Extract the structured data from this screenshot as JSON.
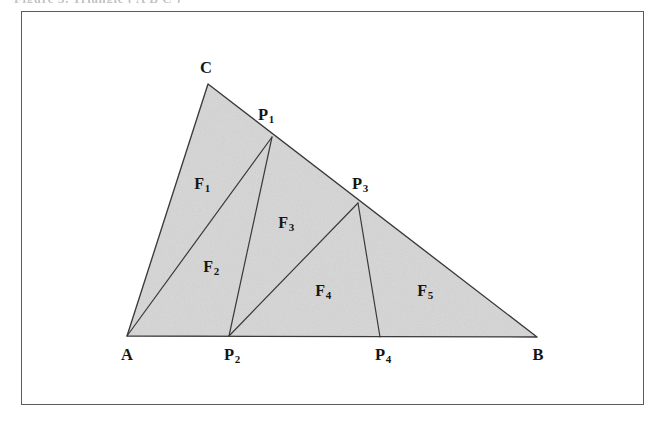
{
  "figure": {
    "caption_sliver": "Figure 3.  Triangle  ( A B C )",
    "frame": {
      "x": 21,
      "y": 11,
      "width": 623,
      "height": 394,
      "border_color": "#5c5c60"
    },
    "background_color": "#ffffff",
    "fill_color": "#d6d6d6",
    "stroke_color": "#3a3a3a"
  },
  "diagram": {
    "type": "geometry-triangle-subdivision",
    "outline": [
      "A",
      "C",
      "B"
    ],
    "points": {
      "A": {
        "x": 127,
        "y": 336,
        "label": "A"
      },
      "B": {
        "x": 537,
        "y": 337,
        "label": "B"
      },
      "C": {
        "x": 208,
        "y": 84,
        "label": "C"
      },
      "P1": {
        "x": 272,
        "y": 137,
        "label": "P",
        "sub": "1"
      },
      "P2": {
        "x": 229,
        "y": 336,
        "label": "P",
        "sub": "2"
      },
      "P3": {
        "x": 358,
        "y": 203,
        "label": "P",
        "sub": "3"
      },
      "P4": {
        "x": 380,
        "y": 337,
        "label": "P",
        "sub": "4"
      }
    },
    "point_labels": [
      {
        "id": "C",
        "text": "C",
        "sub": "",
        "x": 206,
        "y": 68
      },
      {
        "id": "P1",
        "text": "P",
        "sub": "1",
        "x": 265,
        "y": 115
      },
      {
        "id": "P3",
        "text": "P",
        "sub": "3",
        "x": 359,
        "y": 184
      },
      {
        "id": "A",
        "text": "A",
        "sub": "",
        "x": 127,
        "y": 355
      },
      {
        "id": "P2",
        "text": "P",
        "sub": "2",
        "x": 231,
        "y": 355
      },
      {
        "id": "P4",
        "text": "P",
        "sub": "4",
        "x": 382,
        "y": 355
      },
      {
        "id": "B",
        "text": "B",
        "sub": "",
        "x": 538,
        "y": 355
      }
    ],
    "cevians": [
      {
        "from": "A",
        "to": "P1"
      },
      {
        "from": "P2",
        "to": "P1"
      },
      {
        "from": "P2",
        "to": "P3"
      },
      {
        "from": "P4",
        "to": "P3"
      }
    ],
    "regions": [
      {
        "id": "F1",
        "text": "F",
        "sub": "1",
        "x": 202,
        "y": 184,
        "vertices": [
          "C",
          "P1",
          "A"
        ]
      },
      {
        "id": "F2",
        "text": "F",
        "sub": "2",
        "x": 211,
        "y": 267,
        "vertices": [
          "A",
          "P1",
          "P2"
        ]
      },
      {
        "id": "F3",
        "text": "F",
        "sub": "3",
        "x": 286,
        "y": 223,
        "vertices": [
          "P1",
          "P3",
          "P2"
        ]
      },
      {
        "id": "F4",
        "text": "F",
        "sub": "4",
        "x": 323,
        "y": 291,
        "vertices": [
          "P2",
          "P3",
          "P4"
        ]
      },
      {
        "id": "F5",
        "text": "F",
        "sub": "5",
        "x": 425,
        "y": 291,
        "vertices": [
          "P4",
          "P3",
          "B"
        ]
      }
    ]
  }
}
